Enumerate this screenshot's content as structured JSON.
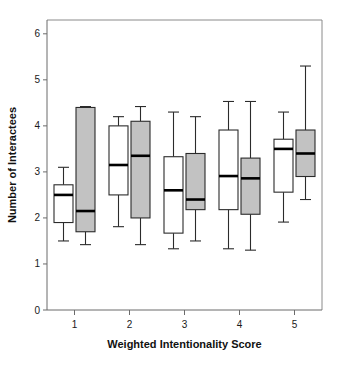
{
  "chart_data": {
    "type": "box",
    "title": "",
    "xlabel": "Weighted Intentionality Score",
    "ylabel": "Number of Interactees",
    "xlim": [
      0.5,
      5.5
    ],
    "ylim": [
      0,
      6.3
    ],
    "yticks": [
      0,
      1,
      2,
      3,
      4,
      5,
      6
    ],
    "ytick_labels": [
      "0",
      "1",
      "2",
      "3",
      "4",
      "5",
      "6"
    ],
    "xticks": [
      1,
      2,
      3,
      4,
      5
    ],
    "xtick_labels": [
      "1",
      "2",
      "3",
      "4",
      "5"
    ],
    "grid": false,
    "legend": "none",
    "categories": [
      "1",
      "2",
      "3",
      "4",
      "5"
    ],
    "colors": {
      "series_a_fill": "#ffffff",
      "series_b_fill": "#c2c2c2",
      "outline": "#2b2b2b",
      "median": "#000000",
      "axis": "#6b6b6b",
      "frame": "#8a8a8a",
      "text": "#111111"
    },
    "series": [
      {
        "name": "white",
        "fill": "#ffffff",
        "boxes": [
          {
            "category": "1",
            "whisker_low": 1.5,
            "q1": 1.9,
            "median": 2.5,
            "q3": 2.72,
            "whisker_high": 3.1
          },
          {
            "category": "2",
            "whisker_low": 1.81,
            "q1": 2.5,
            "median": 3.15,
            "q3": 4.0,
            "whisker_high": 4.2
          },
          {
            "category": "3",
            "whisker_low": 1.33,
            "q1": 1.67,
            "median": 2.6,
            "q3": 3.33,
            "whisker_high": 4.3
          },
          {
            "category": "4",
            "whisker_low": 1.33,
            "q1": 2.18,
            "median": 2.91,
            "q3": 3.91,
            "whisker_high": 4.53
          },
          {
            "category": "5",
            "whisker_low": 1.91,
            "q1": 2.56,
            "median": 3.5,
            "q3": 3.71,
            "whisker_high": 4.3
          }
        ]
      },
      {
        "name": "gray",
        "fill": "#c2c2c2",
        "boxes": [
          {
            "category": "1",
            "whisker_low": 1.42,
            "q1": 1.7,
            "median": 2.15,
            "q3": 4.4,
            "whisker_high": 4.42
          },
          {
            "category": "2",
            "whisker_low": 1.42,
            "q1": 2.0,
            "median": 3.35,
            "q3": 4.1,
            "whisker_high": 4.42
          },
          {
            "category": "3",
            "whisker_low": 1.5,
            "q1": 2.18,
            "median": 2.4,
            "q3": 3.4,
            "whisker_high": 4.2
          },
          {
            "category": "4",
            "whisker_low": 1.3,
            "q1": 2.08,
            "median": 2.86,
            "q3": 3.3,
            "whisker_high": 4.53
          },
          {
            "category": "5",
            "whisker_low": 2.4,
            "q1": 2.9,
            "median": 3.4,
            "q3": 3.91,
            "whisker_high": 5.3
          }
        ]
      }
    ]
  }
}
